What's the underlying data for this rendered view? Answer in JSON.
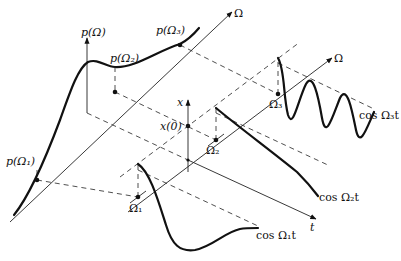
{
  "figure": {
    "colors": {
      "ink": "#111111",
      "background": "#ffffff"
    }
  },
  "labels": {
    "back_omega_axis": "Ω",
    "front_omega_axis": "Ω",
    "p_axis": "p(Ω)",
    "p_omega1": "p(Ω₁)",
    "p_omega2": "p(Ω₂)",
    "p_omega3": "p(Ω₃)",
    "x_axis": "x",
    "x0": "x(0)",
    "t_axis": "t",
    "omega1": "Ω₁",
    "omega2": "Ω₂",
    "omega3": "Ω₃",
    "cos1": "cos Ω₁t",
    "cos2": "cos Ω₂t",
    "cos3": "cos Ω₃t"
  },
  "icons": {
    "arrowhead": "filled-triangle"
  }
}
